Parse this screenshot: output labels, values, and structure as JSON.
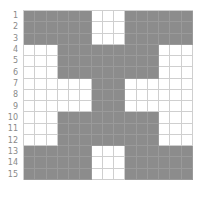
{
  "row_labels": [
    "1",
    "2",
    "3",
    "4",
    "5",
    "6",
    "7",
    "8",
    "9",
    "10",
    "11",
    "12",
    "13",
    "14",
    "15"
  ],
  "colors": {
    "filled": "#8c8c8c",
    "empty": "#ffffff",
    "grid_line": "#cfcfcf",
    "label": "#8a8a8a"
  },
  "grid": {
    "rows": 15,
    "cols": 15,
    "pattern": [
      "111111000111111",
      "111111000111111",
      "111111000111111",
      "000111111111000",
      "000111111111000",
      "000111111111000",
      "000000111000000",
      "000000111000000",
      "000000111000000",
      "000111111111000",
      "000111111111000",
      "000111111111000",
      "111111000111111",
      "111111000111111",
      "111111000111111"
    ]
  }
}
